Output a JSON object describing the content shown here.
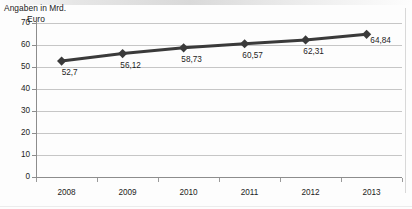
{
  "chart_data": {
    "type": "line",
    "title": "",
    "axis_note_line1": "Angaben in Mrd.",
    "axis_note_line2": "Euro",
    "xlabel": "",
    "ylabel": "Angaben in Mrd. Euro",
    "categories": [
      "2008",
      "2009",
      "2010",
      "2011",
      "2012",
      "2013"
    ],
    "values": [
      52.7,
      56.12,
      58.73,
      60.57,
      62.31,
      64.84
    ],
    "data_labels": [
      "52,7",
      "56,12",
      "58,73",
      "60,57",
      "62,31",
      "64,84"
    ],
    "ylim": [
      0,
      70
    ],
    "ytick_labels": [
      "70",
      "60",
      "50",
      "40",
      "30",
      "20",
      "10",
      "0"
    ],
    "ytick_values": [
      70,
      60,
      50,
      40,
      30,
      20,
      10,
      0
    ],
    "grid": true,
    "legend": "none",
    "marker": "diamond",
    "series": [
      {
        "name": "Angaben in Mrd. Euro",
        "values": [
          52.7,
          56.12,
          58.73,
          60.57,
          62.31,
          64.84
        ]
      }
    ],
    "colors": {
      "line": "#3a3a3a",
      "marker": "#3a3a3a",
      "grid": "#c6c6c6",
      "axis": "#8d8d8d",
      "text": "#1c1c1c",
      "background": "#fdfdfd"
    }
  }
}
